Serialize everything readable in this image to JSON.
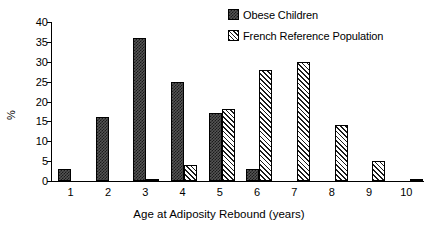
{
  "chart_data": {
    "type": "bar",
    "title": "",
    "subtitle": "",
    "xlabel": "Age at Adiposity Rebound (years)",
    "ylabel": "%",
    "categories": [
      "1",
      "2",
      "3",
      "4",
      "5",
      "6",
      "7",
      "8",
      "9",
      "10"
    ],
    "ylim": [
      0,
      40
    ],
    "yticks": [
      "0",
      "5",
      "10",
      "15",
      "20",
      "25",
      "30",
      "35",
      "40"
    ],
    "grid": false,
    "legend_position": "top-right",
    "series": [
      {
        "name": "Obese Children",
        "pattern": "checkered",
        "color": "#3a3a3a",
        "values": [
          3,
          16,
          36,
          25,
          17,
          3,
          0,
          0,
          0,
          0
        ]
      },
      {
        "name": "French Reference Population",
        "pattern": "diagonal-hatch",
        "color": "#ffffff",
        "values": [
          0,
          0,
          0.5,
          4,
          18,
          28,
          30,
          14,
          5,
          0.5
        ]
      }
    ]
  },
  "legend": {
    "items": [
      {
        "label": "Obese Children",
        "swatch": "checkered-swatch-icon"
      },
      {
        "label": "French Reference Population",
        "swatch": "hatched-swatch-icon"
      }
    ]
  }
}
